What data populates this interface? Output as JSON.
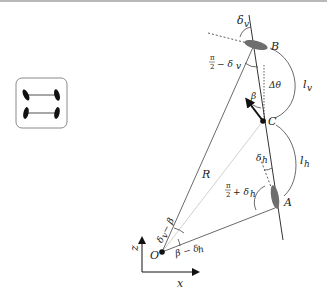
{
  "diagram": {
    "points": {
      "O": "O",
      "A": "A",
      "B": "B",
      "C": "C"
    },
    "axes": {
      "horizontal": "x",
      "vertical": "z"
    },
    "labels": {
      "radius": "R",
      "l_v": "l",
      "l_v_sub": "v",
      "l_h": "l",
      "l_h_sub": "h",
      "delta_v": "δ",
      "delta_v_sub": "v",
      "delta_h": "δ",
      "delta_h_sub": "h",
      "beta": "β",
      "delta_theta": "Δθ",
      "pi_over_2_minus_delta_v": "− δ",
      "pi_over_2_minus_delta_v_sub": "v",
      "pi_over_2_plus_delta_h": "+ δ",
      "pi_over_2_plus_delta_h_sub": "h",
      "pi": "π",
      "two": "2",
      "delta_v_minus_beta": "δ",
      "delta_v_minus_beta_sub": "v",
      "delta_v_minus_beta_tail": "− β",
      "beta_minus_delta_h": "β − δ",
      "beta_minus_delta_h_sub": "h"
    },
    "car_icon": {
      "description": "top-view vehicle with four wheels (front and rear axles)"
    },
    "colors": {
      "line": "#333333",
      "radius_line": "#bdbdbd",
      "wheel_fill": "#6e6e6e",
      "car_wheel": "#111111",
      "car_box": "#8a8a8a"
    }
  }
}
